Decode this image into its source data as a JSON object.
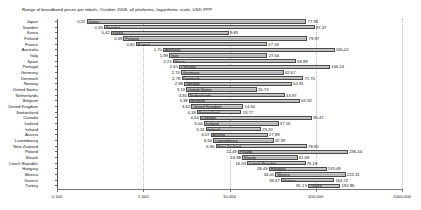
{
  "chart_data": {
    "type": "bar",
    "subtype": "floating-range-bar",
    "title": "Range of broadband prices per mbit/s, October 2008, all platforms, logarithmic scale, USD PPP",
    "xlabel": "",
    "ylabel": "",
    "xscale": "log",
    "xlim": [
      0.1,
      1000
    ],
    "grid": true,
    "legend": "none",
    "xtick_labels": [
      "0,100",
      "1,000",
      "10,000",
      "100,000",
      "1000,000"
    ],
    "xtick_values": [
      0.1,
      1,
      10,
      100,
      1000
    ],
    "value_key": [
      "min",
      "max"
    ],
    "categories": [
      "Japan",
      "Sweden",
      "Korea",
      "Finland",
      "France",
      "Australia",
      "Italy",
      "Spain",
      "Portugal",
      "Germany",
      "Denmark",
      "Norway",
      "United States",
      "Netherlands",
      "Belgium",
      "United Kingdom",
      "Switzerland",
      "Canada",
      "Ireland",
      "Austria",
      "Luxembourg",
      "New Zealand",
      "Poland",
      "Slovak",
      "Czech Republic",
      "Hungary",
      "Mexico",
      "Greece",
      "Turkey"
    ],
    "rows": [
      {
        "name": "Japan",
        "min": 0.22,
        "max": 77.94,
        "min_label": "0,22",
        "max_label": "77,94"
      },
      {
        "name": "Sweden",
        "min": 0.35,
        "max": 97.47,
        "min_label": "0,35",
        "max_label": "97,47"
      },
      {
        "name": "Korea",
        "min": 0.42,
        "max": 9.83,
        "min_label": "0,42",
        "max_label": "9,83"
      },
      {
        "name": "Finland",
        "min": 0.59,
        "max": 79.97,
        "min_label": "0,59",
        "max_label": "79,97"
      },
      {
        "name": "France",
        "min": 0.82,
        "max": 27.33,
        "min_label": "0,82",
        "max_label": "27,33"
      },
      {
        "name": "Australia",
        "min": 1.7,
        "max": 165.02,
        "min_label": "1,70",
        "max_label": "165,02"
      },
      {
        "name": "Italy",
        "min": 1.99,
        "max": 27.54,
        "min_label": "1,99",
        "max_label": "27,54"
      },
      {
        "name": "Spain",
        "min": 2.21,
        "max": 58.89,
        "min_label": "2,21",
        "max_label": "58,89"
      },
      {
        "name": "Portugal",
        "min": 2.61,
        "max": 146.24,
        "min_label": "2,61",
        "max_label": "146,24"
      },
      {
        "name": "Germany",
        "min": 2.74,
        "max": 42.67,
        "min_label": "2,74",
        "max_label": "42,67"
      },
      {
        "name": "Denmark",
        "min": 2.78,
        "max": 71.7,
        "min_label": "2,78",
        "max_label": "71,70"
      },
      {
        "name": "Norway",
        "min": 2.98,
        "max": 52.91,
        "min_label": "2,98",
        "max_label": "52,91"
      },
      {
        "name": "United States",
        "min": 3.13,
        "max": 20.74,
        "min_label": "3,13",
        "max_label": "20,74"
      },
      {
        "name": "Netherlands",
        "min": 3.3,
        "max": 43.87,
        "min_label": "3,30",
        "max_label": "43,87"
      },
      {
        "name": "Belgium",
        "min": 3.38,
        "max": 65.92,
        "min_label": "3,38",
        "max_label": "65,92"
      },
      {
        "name": "United Kingdom",
        "min": 3.62,
        "max": 14.5,
        "min_label": "3,62",
        "max_label": "14,50"
      },
      {
        "name": "Switzerland",
        "min": 4.18,
        "max": 13.77,
        "min_label": "4,18",
        "max_label": "13,77"
      },
      {
        "name": "Canada",
        "min": 4.54,
        "max": 90.47,
        "min_label": "4,54",
        "max_label": "90,47"
      },
      {
        "name": "Iceland",
        "min": 5.04,
        "max": 37.16,
        "min_label": "5,04",
        "max_label": "37,16"
      },
      {
        "name": "Ireland",
        "min": 5.31,
        "max": 23.2,
        "min_label": "5,31",
        "max_label": "23,20"
      },
      {
        "name": "Austria",
        "min": 6.07,
        "max": 27.89,
        "min_label": "6,07",
        "max_label": "27,89"
      },
      {
        "name": "Luxembourg",
        "min": 6.5,
        "max": 32.39,
        "min_label": "6,50",
        "max_label": "32,39"
      },
      {
        "name": "New Zealand",
        "min": 6.9,
        "max": 78.9,
        "min_label": "6,90",
        "max_label": "78,90"
      },
      {
        "name": "Poland",
        "min": 12.49,
        "max": 236.44,
        "min_label": "12,49",
        "max_label": "236,44"
      },
      {
        "name": "Slovak",
        "min": 13.98,
        "max": 61.58,
        "min_label": "13,98",
        "max_label": "61,58"
      },
      {
        "name": "Czech Republic",
        "min": 16.03,
        "max": 76.18,
        "min_label": "16,03",
        "max_label": "76,18"
      },
      {
        "name": "Hungary",
        "min": 28.49,
        "max": 133.49,
        "min_label": "28,49",
        "max_label": "133,49"
      },
      {
        "name": "Mexico",
        "min": 34.01,
        "max": 222.31,
        "min_label": "34,01",
        "max_label": "222,31"
      },
      {
        "name": "Greece",
        "min": 39.47,
        "max": 163.72,
        "min_label": "39,47",
        "max_label": "163,72"
      },
      {
        "name": "Turkey",
        "min": 81.13,
        "max": 192.86,
        "min_label": "81,13",
        "max_label": "192,86"
      }
    ]
  }
}
